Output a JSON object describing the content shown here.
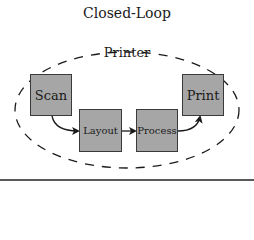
{
  "diagram": {
    "outer_label": "Closed-Loop",
    "inner_label": "Printer",
    "nodes": [
      {
        "id": "scan",
        "label": "Scan"
      },
      {
        "id": "layout",
        "label": "Layout"
      },
      {
        "id": "process",
        "label": "Process"
      },
      {
        "id": "print",
        "label": "Print"
      }
    ],
    "edges": [
      {
        "from": "scan",
        "to": "layout"
      },
      {
        "from": "layout",
        "to": "process"
      },
      {
        "from": "process",
        "to": "print"
      }
    ],
    "colors": {
      "box_fill": "#a6a6a6",
      "box_border": "#3a3a3a",
      "text": "#1a1a1a",
      "dashed_ellipse": "#1a1a1a"
    }
  }
}
